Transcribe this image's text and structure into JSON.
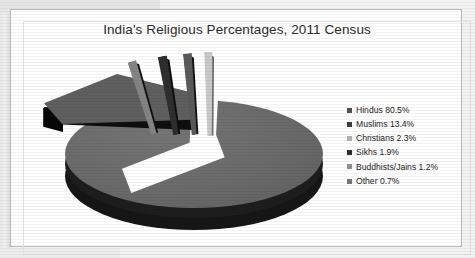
{
  "page": {
    "background_color": "#ffffff",
    "border_color": "#b9b9b9"
  },
  "chart": {
    "title": "India's Religious Percentages, 2011 Census",
    "title_color": "#2b2b2b"
  },
  "legend": {
    "position": "right",
    "items": [
      {
        "label": "Hindus 80.5%",
        "swatch": "#4f4f4f"
      },
      {
        "label": "Muslims 13.4%",
        "swatch": "#3d3d3d"
      },
      {
        "label": "Christians 2.3%",
        "swatch": "#b4b4b4"
      },
      {
        "label": "Sikhs 1.9%",
        "swatch": "#2f2f2f"
      },
      {
        "label": "Buddhists/Jains 1.2%",
        "swatch": "#909090"
      },
      {
        "label": "Other 0.7%",
        "swatch": "#777777"
      }
    ]
  },
  "chart_data": {
    "type": "pie",
    "title": "India's Religious Percentages, 2011 Census",
    "subtitle": "",
    "xlabel": "",
    "ylabel": "",
    "categories": [
      "Hindus",
      "Muslims",
      "Christians",
      "Sikhs",
      "Buddhists/Jains",
      "Other"
    ],
    "values": [
      80.5,
      13.4,
      2.3,
      1.9,
      1.2,
      0.7
    ],
    "value_labels": [
      "80.5%",
      "13.4%",
      "2.3%",
      "1.9%",
      "1.2%",
      "0.7%"
    ],
    "units": "percent",
    "colors": [
      "#6a6a6a",
      "#5f5f5f",
      "#848484",
      "#2e2e2e",
      "#5a5a5a",
      "#c9c9c9"
    ],
    "exploded": [
      "Muslims",
      "Christians",
      "Sikhs",
      "Buddhists/Jains",
      "Other"
    ],
    "style": "3d-exploded-pie",
    "grid": false,
    "legend_position": "right",
    "annotations": []
  }
}
